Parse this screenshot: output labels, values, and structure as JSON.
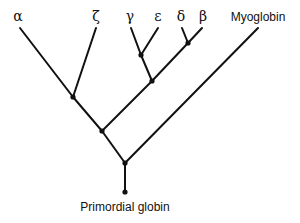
{
  "diagram": {
    "type": "phylogenetic-tree",
    "leaves": [
      {
        "id": "alpha",
        "label": "α"
      },
      {
        "id": "zeta",
        "label": "ζ"
      },
      {
        "id": "gamma",
        "label": "γ"
      },
      {
        "id": "epsilon",
        "label": "ε"
      },
      {
        "id": "delta",
        "label": "δ"
      },
      {
        "id": "beta",
        "label": "β"
      },
      {
        "id": "myoglobin",
        "label": "Myoglobin"
      }
    ],
    "root": {
      "id": "primordial",
      "label": "Primordial globin"
    },
    "topology": "(((α,ζ),((γ,ε),(δ,β))),Myoglobin) ← Primordial globin",
    "colors": {
      "line": "#111111",
      "background": "#ffffff"
    }
  }
}
